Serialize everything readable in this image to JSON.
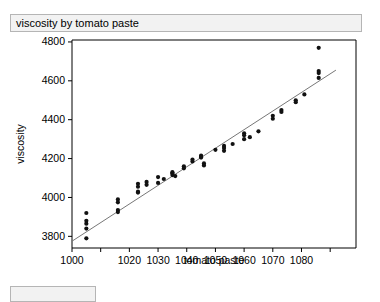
{
  "window": {
    "title": "viscosity by tomato paste"
  },
  "bottom_panel": {
    "label": ""
  },
  "chart_data": {
    "type": "scatter",
    "title": "viscosity by tomato paste",
    "xlabel": "tomato paste",
    "ylabel": "viscosity",
    "xlim": [
      1000,
      1099
    ],
    "ylim": [
      3740,
      4810
    ],
    "grid": false,
    "legend": null,
    "xticks": [
      1000,
      1010,
      1020,
      1030,
      1040,
      1050,
      1060,
      1070,
      1080,
      1090
    ],
    "xtick_labels": [
      "1000",
      "",
      "1020",
      "1030",
      "1040",
      "1050",
      "1060",
      "1070",
      "1080",
      ""
    ],
    "yticks": [
      3800,
      4000,
      4200,
      4400,
      4600,
      4800
    ],
    "ytick_labels": [
      "3800",
      "4000",
      "4200",
      "4400",
      "4600",
      "4800"
    ],
    "series": [
      {
        "name": "observations",
        "marker": "filled-circle",
        "color": "#111111",
        "points": [
          [
            1005,
            3920
          ],
          [
            1005,
            3880
          ],
          [
            1005,
            3865
          ],
          [
            1005,
            3840
          ],
          [
            1005,
            3790
          ],
          [
            1016,
            3990
          ],
          [
            1016,
            3975
          ],
          [
            1016,
            3935
          ],
          [
            1016,
            3925
          ],
          [
            1023,
            4070
          ],
          [
            1023,
            4055
          ],
          [
            1023,
            4030
          ],
          [
            1023,
            4025
          ],
          [
            1026,
            4080
          ],
          [
            1026,
            4065
          ],
          [
            1030,
            4105
          ],
          [
            1030,
            4075
          ],
          [
            1032,
            4095
          ],
          [
            1035,
            4130
          ],
          [
            1035,
            4125
          ],
          [
            1035,
            4115
          ],
          [
            1036,
            4110
          ],
          [
            1039,
            4160
          ],
          [
            1039,
            4150
          ],
          [
            1042,
            4195
          ],
          [
            1042,
            4185
          ],
          [
            1045,
            4215
          ],
          [
            1045,
            4210
          ],
          [
            1045,
            4205
          ],
          [
            1046,
            4175
          ],
          [
            1046,
            4165
          ],
          [
            1050,
            4245
          ],
          [
            1053,
            4265
          ],
          [
            1053,
            4255
          ],
          [
            1053,
            4240
          ],
          [
            1056,
            4275
          ],
          [
            1060,
            4330
          ],
          [
            1060,
            4320
          ],
          [
            1060,
            4300
          ],
          [
            1062,
            4310
          ],
          [
            1065,
            4340
          ],
          [
            1070,
            4420
          ],
          [
            1070,
            4405
          ],
          [
            1073,
            4450
          ],
          [
            1073,
            4440
          ],
          [
            1078,
            4500
          ],
          [
            1078,
            4490
          ],
          [
            1081,
            4530
          ],
          [
            1086,
            4770
          ],
          [
            1086,
            4650
          ],
          [
            1086,
            4640
          ],
          [
            1086,
            4615
          ]
        ]
      }
    ],
    "fit_line": {
      "name": "linear fit",
      "color": "#777777",
      "x_start": 1000,
      "y_start": 3775,
      "x_end": 1092,
      "y_end": 4655
    }
  }
}
